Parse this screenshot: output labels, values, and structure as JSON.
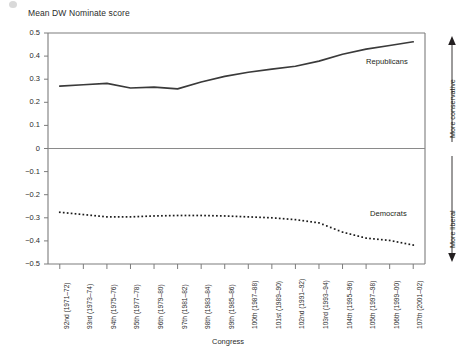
{
  "chart_data": {
    "type": "line",
    "title": "Mean DW Nominate score",
    "ylabel": "Mean DW Nominate score",
    "xlabel": "Congress",
    "ylim": [
      -0.5,
      0.5
    ],
    "grid": false,
    "legend_position": "inline-annotation",
    "yticks": [
      "0.5",
      "0.4",
      "0.3",
      "0.2",
      "0.1",
      "0",
      "-0.1",
      "-0.2",
      "-0.3",
      "-0.4",
      "-0.5"
    ],
    "ytick_values": [
      0.5,
      0.4,
      0.3,
      0.2,
      0.1,
      0,
      -0.1,
      -0.2,
      -0.3,
      -0.4,
      -0.5
    ],
    "categories": [
      "92nd (1971–72)",
      "93rd (1973–74)",
      "94th (1975–76)",
      "95th (1977–78)",
      "96th (1979–80)",
      "97th (1981–82)",
      "98th (1983–84)",
      "99th (1985–86)",
      "100th (1987–88)",
      "101st (1989–90)",
      "102nd (1991–92)",
      "103rd (1993–94)",
      "104th (1995–96)",
      "105th (1997–98)",
      "106th (1999–00)",
      "107th (2001–02)"
    ],
    "series": [
      {
        "name": "Republicans",
        "style": "solid",
        "color": "#3a3a3a",
        "values": [
          0.27,
          0.276,
          0.282,
          0.262,
          0.266,
          0.258,
          0.288,
          0.312,
          0.33,
          0.344,
          0.356,
          0.378,
          0.408,
          0.43,
          0.446,
          0.462
        ]
      },
      {
        "name": "Democrats",
        "style": "dotted",
        "color": "#1a1a1a",
        "values": [
          -0.276,
          -0.286,
          -0.296,
          -0.296,
          -0.292,
          -0.29,
          -0.29,
          -0.292,
          -0.296,
          -0.3,
          -0.308,
          -0.322,
          -0.362,
          -0.388,
          -0.398,
          -0.418
        ]
      }
    ],
    "annotations": [
      {
        "name": "republicans-label",
        "text": "Republicans"
      },
      {
        "name": "democrats-label",
        "text": "Democrats"
      },
      {
        "name": "more-conservative-note",
        "text": "More conservative"
      },
      {
        "name": "more-liberal-note",
        "text": "More liberal"
      }
    ]
  }
}
